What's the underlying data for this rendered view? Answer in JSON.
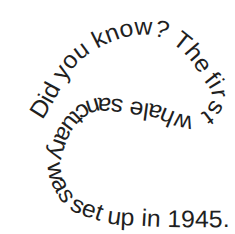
{
  "page": {
    "background_color": "#ffffff",
    "text_color": "#1f1f1f"
  },
  "curved_text": {
    "content": "Did you know? The first whale sanctuary was set up in 1945."
  }
}
